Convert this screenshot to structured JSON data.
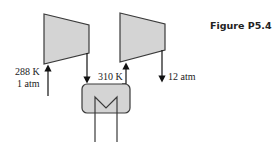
{
  "figure": {
    "title": "Figure P5.4"
  },
  "components": {
    "compressor_1": {
      "label": "compressor 1"
    },
    "compressor_2": {
      "label": "compressor 2"
    },
    "intercooler": {
      "label": "heat exchanger"
    }
  },
  "labels": {
    "inlet_temp": "288 K",
    "inlet_pressure": "1 atm",
    "intercooler_exit_temp": "310 K",
    "outlet_pressure": "12 atm"
  },
  "colors": {
    "fill": "#d4d4d4",
    "stroke": "#3a3a3a"
  }
}
